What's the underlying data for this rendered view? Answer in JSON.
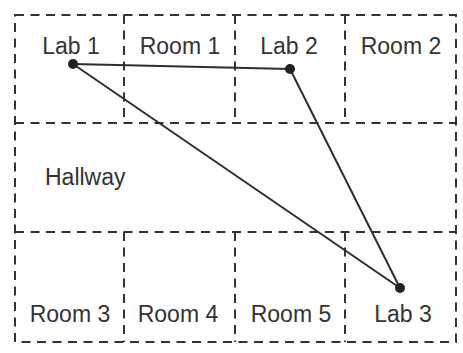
{
  "diagram": {
    "rooms": {
      "lab1": "Lab 1",
      "room1": "Room 1",
      "lab2": "Lab 2",
      "room2": "Room 2",
      "hallway": "Hallway",
      "room3": "Room 3",
      "room4": "Room 4",
      "room5": "Room 5",
      "lab3": "Lab 3"
    },
    "graph": {
      "nodes": [
        "Lab 1",
        "Lab 2",
        "Lab 3"
      ],
      "edges": [
        [
          "Lab 1",
          "Lab 2"
        ],
        [
          "Lab 1",
          "Lab 3"
        ],
        [
          "Lab 2",
          "Lab 3"
        ]
      ]
    },
    "colors": {
      "line": "#333333",
      "edge": "#2e2e2e",
      "node": "#222222",
      "background": "#ffffff"
    }
  }
}
